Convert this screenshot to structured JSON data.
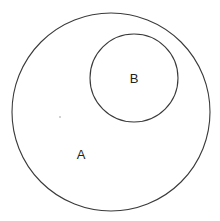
{
  "diagram": {
    "type": "venn-subset",
    "sets": [
      {
        "id": "A",
        "label": "A",
        "cx": 111,
        "cy": 112,
        "r": 99,
        "label_x": 81,
        "label_y": 156
      },
      {
        "id": "B",
        "label": "B",
        "cx": 134,
        "cy": 78,
        "r": 44,
        "label_x": 134,
        "label_y": 80
      }
    ],
    "relation": "B is a subset of A",
    "stroke_color": "#3a3a3a",
    "background": "#ffffff"
  }
}
